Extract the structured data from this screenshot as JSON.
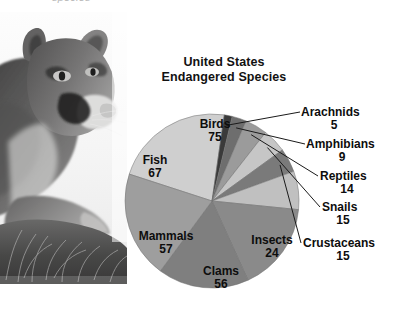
{
  "page": {
    "top_caption": "species"
  },
  "chart": {
    "title_line1": "United States",
    "title_line2": "Endangered Species"
  },
  "photo": {
    "alt": "grayscale photograph of a mountain lion lying in grass"
  },
  "chart_data": {
    "type": "pie",
    "title": "United States Endangered Species",
    "subtitle": "",
    "xlabel": "",
    "ylabel": "",
    "total": 337,
    "legend_position": "labels-on-and-around-slices",
    "grid": false,
    "categories": [
      "Birds",
      "Arachnids",
      "Amphibians",
      "Reptiles",
      "Snails",
      "Crustaceans",
      "Insects",
      "Clams",
      "Mammals",
      "Fish"
    ],
    "values": [
      75,
      5,
      9,
      14,
      15,
      15,
      24,
      56,
      57,
      67
    ],
    "slices": [
      {
        "label": "Birds",
        "value": 75,
        "value_text": "75",
        "color": "#cfcfcf",
        "placement": "inside"
      },
      {
        "label": "Arachnids",
        "value": 5,
        "value_text": "5",
        "color": "#3a3a3a",
        "placement": "callout"
      },
      {
        "label": "Amphibians",
        "value": 9,
        "value_text": "9",
        "color": "#6e6e6e",
        "placement": "callout"
      },
      {
        "label": "Reptiles",
        "value": 14,
        "value_text": "14",
        "color": "#9b9b9b",
        "placement": "callout"
      },
      {
        "label": "Snails",
        "value": 15,
        "value_text": "15",
        "color": "#c6c6c6",
        "placement": "callout"
      },
      {
        "label": "Crustaceans",
        "value": 15,
        "value_text": "15",
        "color": "#7a7a7a",
        "placement": "callout"
      },
      {
        "label": "Insects",
        "value": 24,
        "value_text": "24",
        "color": "#c0c0c0",
        "placement": "inside"
      },
      {
        "label": "Clams",
        "value": 56,
        "value_text": "56",
        "color": "#8a8a8a",
        "placement": "inside"
      },
      {
        "label": "Mammals",
        "value": 57,
        "value_text": "57",
        "color": "#7f7f7f",
        "placement": "inside"
      },
      {
        "label": "Fish",
        "value": 67,
        "value_text": "67",
        "color": "#9e9e9e",
        "placement": "inside"
      }
    ]
  }
}
